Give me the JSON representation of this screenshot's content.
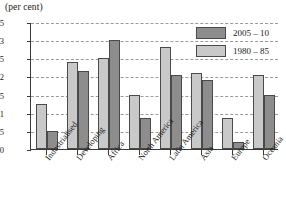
{
  "chart_data": {
    "type": "bar",
    "title": "(per cent)",
    "xlabel": "",
    "ylabel": "",
    "ylim": [
      0,
      3.5
    ],
    "ytick_labels": [
      "0",
      "0.5",
      "1",
      "1.5",
      "2",
      "2.5",
      "3",
      "3.5"
    ],
    "ytick_values": [
      0,
      0.5,
      1,
      1.5,
      2,
      2.5,
      3,
      3.5
    ],
    "grid": true,
    "legend_position": "top-right",
    "categories": [
      "Industrialised",
      "Developing",
      "Africa",
      "North America",
      "Latin America",
      "Asia",
      "Europe",
      "Oceania"
    ],
    "series": [
      {
        "name": "1980 – 85",
        "color": "#c9c9c9",
        "values": [
          1.25,
          2.4,
          2.5,
          1.5,
          2.8,
          2.1,
          0.85,
          2.05
        ]
      },
      {
        "name": "2005 – 10",
        "color": "#8d8d8d",
        "values": [
          0.5,
          2.15,
          3.0,
          0.85,
          2.05,
          1.9,
          0.2,
          1.5
        ]
      }
    ]
  },
  "legend": {
    "entries": [
      {
        "label": "2005 – 10",
        "swatch": "dark"
      },
      {
        "label": "1980 – 85",
        "swatch": "light"
      }
    ]
  }
}
